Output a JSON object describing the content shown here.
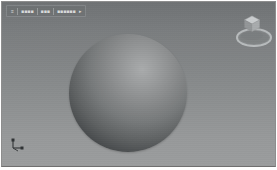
{
  "window": {
    "title": "3D Modeling Viewport",
    "background_top": "#6f7274",
    "background_bottom": "#9b9d9e",
    "frame_color": "#8d8d8d"
  },
  "breadcrumb": {
    "name": "model-breadcrumb-bar",
    "items": [
      {
        "label": "≡"
      },
      {
        "label": "■■■■"
      },
      {
        "label": "■■■"
      },
      {
        "label": "■■■■■■"
      }
    ],
    "caret": "▸"
  },
  "viewcube": {
    "label": "ViewCube navigation gizmo",
    "cube_top_color": "#c9ccce",
    "cube_left_color": "#9a9d9f",
    "cube_right_color": "#aeb1b3",
    "ring_color": "#c6c9cb"
  },
  "axis_triad": {
    "label": "origin axis indicator",
    "color": "#3a3d3f"
  },
  "scene": {
    "object": "sphere",
    "material": "grey shaded",
    "highlight_color": "#a9abac",
    "shadow_color": "#212426",
    "center_x": 126,
    "center_y": 91,
    "diameter": 118
  }
}
